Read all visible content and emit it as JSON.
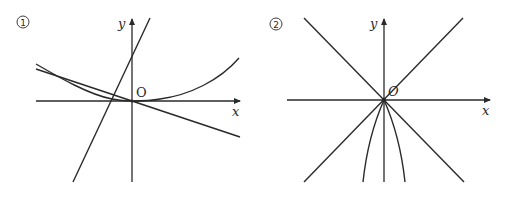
{
  "figures": [
    {
      "id": "figure-1",
      "number_label": "1",
      "y_label": "y",
      "x_label": "x",
      "origin_label": "O",
      "description": "Axes with a steep increasing line, a decreasing line through the origin, and a curve decreasing from the left, touching the x-axis near the origin, then increasing to the right"
    },
    {
      "id": "figure-2",
      "number_label": "2",
      "y_label": "y",
      "x_label": "x",
      "origin_label": "O",
      "description": "Axes with two diagonal lines crossing at the origin, and two downward-opening curves emanating from the origin below the x-axis, symmetric about the y-axis"
    }
  ],
  "colors": {
    "stroke": "#2a2a2a",
    "background": "#ffffff"
  }
}
